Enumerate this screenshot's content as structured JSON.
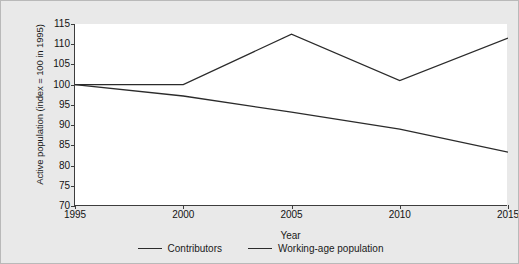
{
  "chart_data": {
    "type": "line",
    "title": "",
    "xlabel": "Year",
    "ylabel": "Active population (index = 100 in 1995)",
    "x": [
      1995,
      2000,
      2005,
      2010,
      2015
    ],
    "xtick_labels": [
      "1995",
      "2000",
      "2005",
      "2010",
      "2015"
    ],
    "ytick_labels": [
      "70",
      "75",
      "80",
      "85",
      "90",
      "95",
      "100",
      "105",
      "110",
      "115"
    ],
    "yticks": [
      70,
      75,
      80,
      85,
      90,
      95,
      100,
      105,
      110,
      115
    ],
    "xlim": [
      1995,
      2015
    ],
    "ylim": [
      70,
      115
    ],
    "grid": false,
    "legend_position": "bottom",
    "series": [
      {
        "name": "Contributors",
        "values": [
          100,
          100,
          112.5,
          101,
          111.5
        ],
        "color": "#2b2b2b"
      },
      {
        "name": "Working-age population",
        "values": [
          100,
          97.2,
          93.2,
          89,
          83.3
        ],
        "color": "#2b2b2b"
      }
    ]
  },
  "colors": {
    "background": "#e9e9e9",
    "plot_background": "#ffffff",
    "axis": "#3d3d3d",
    "line": "#2b2b2b",
    "text": "#1a1a1a"
  }
}
